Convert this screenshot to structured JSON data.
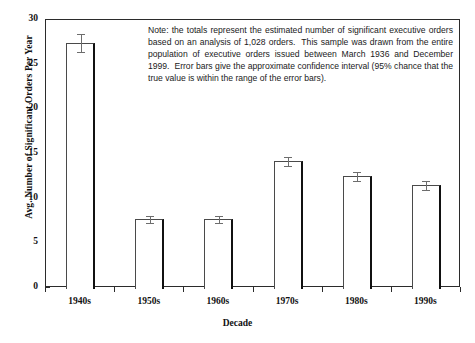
{
  "chart_data": {
    "type": "bar",
    "title": "",
    "xlabel": "Decade",
    "ylabel": "Avg. Number of Significant Orders Per Year",
    "categories": [
      "1940s",
      "1950s",
      "1960s",
      "1970s",
      "1980s",
      "1990s"
    ],
    "values": [
      27.4,
      7.7,
      7.7,
      14.2,
      12.5,
      11.5
    ],
    "errors": [
      1.0,
      0.4,
      0.4,
      0.5,
      0.5,
      0.5
    ],
    "ylim": [
      0,
      30
    ],
    "yticks": [
      0,
      5,
      10,
      15,
      20,
      25,
      30
    ],
    "ytick_labels": [
      "0",
      "5",
      "10",
      "15",
      "20",
      "25",
      "30"
    ],
    "grid": false,
    "legend": false,
    "error_bar_description": "approximate 95% confidence interval",
    "annotation": "Note: the totals represent the estimated number of significant executive orders based on an analysis of 1,028 orders.  This sample was drawn from the entire population of executive orders issued between March 1936 and December 1999.  Error bars give the approximate confidence interval (95% chance that the true value is within the range of the error bars)."
  },
  "colors": {
    "bar_face": "#ffffff",
    "bar_edge": "#4a4a4a",
    "bar_shadow": "#111111",
    "axis": "#2b2b2b",
    "text": "#111111",
    "error_bar": "#6d6d6d",
    "background": "#ffffff"
  }
}
